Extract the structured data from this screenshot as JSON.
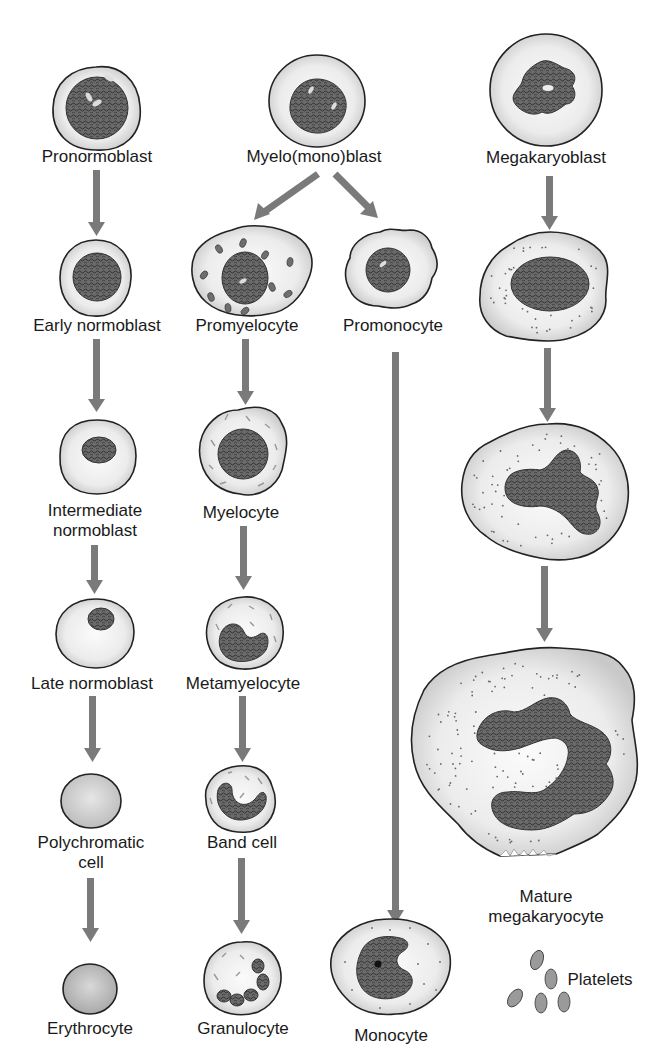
{
  "arrow_color": "#7a7a7a",
  "lineages": {
    "erythroid": {
      "stages": [
        {
          "label_lines": [
            "Pronormoblast"
          ]
        },
        {
          "label_lines": [
            "Early normoblast"
          ]
        },
        {
          "label_lines": [
            "Intermediate",
            "normoblast"
          ]
        },
        {
          "label_lines": [
            "Late normoblast"
          ]
        },
        {
          "label_lines": [
            "Polychromatic",
            "cell"
          ]
        },
        {
          "label_lines": [
            "Erythrocyte"
          ]
        }
      ]
    },
    "myeloid": {
      "root": {
        "label_lines": [
          "Myelo(mono)blast"
        ]
      },
      "granulocytic": [
        {
          "label_lines": [
            "Promyelocyte"
          ]
        },
        {
          "label_lines": [
            "Myelocyte"
          ]
        },
        {
          "label_lines": [
            "Metamyelocyte"
          ]
        },
        {
          "label_lines": [
            "Band cell"
          ]
        },
        {
          "label_lines": [
            "Granulocyte"
          ]
        }
      ],
      "monocytic": [
        {
          "label_lines": [
            "Promonocyte"
          ]
        },
        {
          "label_lines": [
            "Monocyte"
          ]
        }
      ]
    },
    "megakaryocytic": {
      "stages": [
        {
          "label_lines": [
            "Megakaryoblast"
          ]
        },
        {
          "label_lines": []
        },
        {
          "label_lines": []
        },
        {
          "label_lines": [
            "Mature",
            "megakaryocyte"
          ]
        }
      ],
      "product": {
        "label_lines": [
          "Platelets"
        ]
      }
    }
  }
}
